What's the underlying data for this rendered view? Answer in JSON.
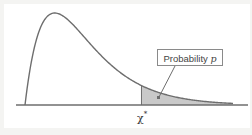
{
  "diagram": {
    "annotation": {
      "label_prefix": "Probability",
      "label_variable": "p"
    },
    "x_axis_label": {
      "symbol": "χ",
      "superscript": "*"
    },
    "colors": {
      "curve": "#6e6e6e",
      "shade": "#c9c9c9",
      "axis": "#6e6e6e",
      "background": "#f4f4f2"
    }
  },
  "chart_data": {
    "type": "area",
    "distribution": "chi-square",
    "degrees_of_freedom": 4,
    "critical_value_label": "χ*",
    "shaded_region": "upper tail (x ≥ χ*)",
    "shaded_region_label": "Probability p",
    "x_range": [
      0,
      14
    ],
    "critical_value_relative_position": 0.56,
    "axis_ticks": [],
    "grid": false
  }
}
